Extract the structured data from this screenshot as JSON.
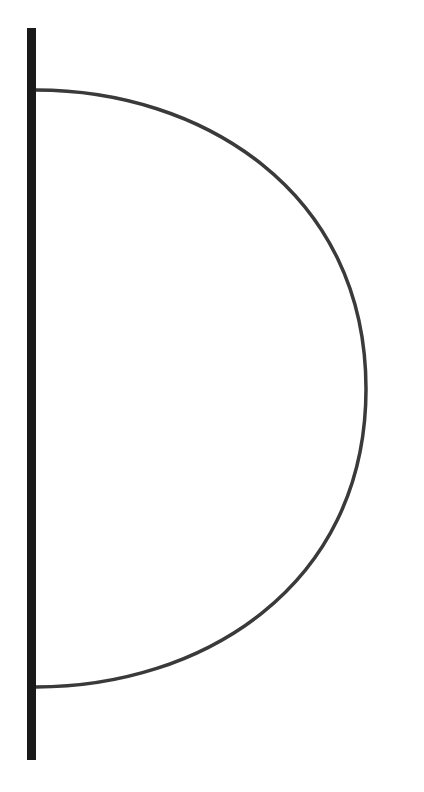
{
  "canvas": {
    "width": 424,
    "height": 792,
    "background_color": "#ffffff",
    "title": "Semicircular arc attached to vertical bar"
  },
  "figure": {
    "name": "half-disc-outline-diagram",
    "elements": {
      "vertical_bar": {
        "label": "vertical-bar",
        "color": "#1a1a1a",
        "x": 27,
        "y_top": 28,
        "y_bottom": 760,
        "width": 9,
        "height": 732
      },
      "arc": {
        "label": "semicircle-arc",
        "color": "#3a3a3a",
        "stroke_width": 3.5,
        "fill": "none",
        "start_point": [
          36,
          90
        ],
        "end_point": [
          36,
          687
        ],
        "rightmost_point": [
          366,
          389
        ],
        "chord_length": 597,
        "bulge_depth": 330,
        "path": "M 36 90 C 200 90 366 190 366 389 C 366 588 200 687 36 687"
      }
    }
  }
}
